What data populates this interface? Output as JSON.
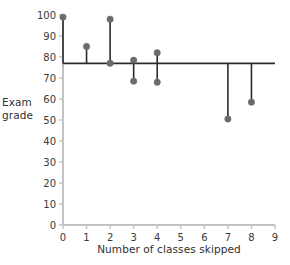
{
  "chart_data": {
    "type": "scatter",
    "title": "",
    "xlabel": "Number of classes skipped",
    "ylabel": "Exam grade",
    "ylabel_lines": [
      "Exam",
      "grade"
    ],
    "xlim": [
      0,
      9
    ],
    "ylim": [
      0,
      100
    ],
    "xticks": [
      0,
      1,
      2,
      3,
      4,
      5,
      6,
      7,
      8,
      9
    ],
    "yticks": [
      0,
      10,
      20,
      30,
      40,
      50,
      60,
      70,
      80,
      90,
      100
    ],
    "grid": false,
    "legend": null,
    "points": [
      {
        "x": 0,
        "y": 99
      },
      {
        "x": 1,
        "y": 85
      },
      {
        "x": 2,
        "y": 98
      },
      {
        "x": 2,
        "y": 77
      },
      {
        "x": 3,
        "y": 78.5
      },
      {
        "x": 3,
        "y": 68.5
      },
      {
        "x": 4,
        "y": 82
      },
      {
        "x": 4,
        "y": 68
      },
      {
        "x": 7,
        "y": 50.5
      },
      {
        "x": 8,
        "y": 58.5
      }
    ],
    "reference_line": {
      "y": 77,
      "x_start": 0,
      "x_end": 9,
      "label": ""
    },
    "residual_lines": [
      {
        "x": 0,
        "y_from": 77,
        "y_to": 99
      },
      {
        "x": 1,
        "y_from": 77,
        "y_to": 85
      },
      {
        "x": 2,
        "y_from": 77,
        "y_to": 98
      },
      {
        "x": 3,
        "y_from": 78.5,
        "y_to": 68.5
      },
      {
        "x": 4,
        "y_from": 82,
        "y_to": 68
      },
      {
        "x": 7,
        "y_from": 77,
        "y_to": 50.5
      },
      {
        "x": 8,
        "y_from": 77,
        "y_to": 58.5
      }
    ],
    "colors": {
      "point": "#6b6b6b",
      "residual_line": "#2b2b2b",
      "reference_line": "#2b2b2b",
      "axis": "#c2c2c2",
      "text": "#3a3a3a",
      "background": "#ffffff"
    }
  }
}
